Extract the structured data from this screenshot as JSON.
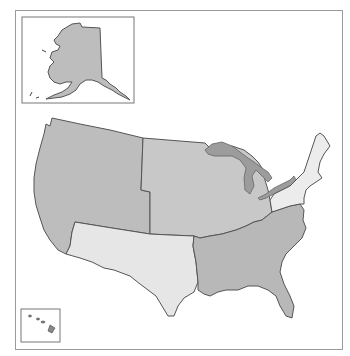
{
  "map": {
    "title": "",
    "regions": [
      {
        "id": "west",
        "label": "West",
        "fill": "#bdbdbd"
      },
      {
        "id": "midwest",
        "label": "Midwest",
        "fill": "#c8c8c8"
      },
      {
        "id": "southwest",
        "label": "Southwest",
        "fill": "#e6e6e6"
      },
      {
        "id": "south",
        "label": "South",
        "fill": "#b8b8b8"
      },
      {
        "id": "northeast",
        "label": "Northeast",
        "fill": "#ececec"
      }
    ],
    "insets": [
      {
        "id": "alaska",
        "label": "Alaska",
        "region": "west"
      },
      {
        "id": "hawaii",
        "label": "Hawaii",
        "region": "west"
      }
    ],
    "colors": {
      "frame": "#9a9a9a",
      "border": "#555555",
      "lakes": "#9c9c9c"
    }
  }
}
